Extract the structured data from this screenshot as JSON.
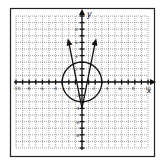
{
  "graph": {
    "axes": {
      "x_label": "x",
      "y_label": "y",
      "x_range": [
        -10,
        10
      ],
      "y_range": [
        -10,
        10
      ]
    },
    "x_ticks": [
      "-10",
      "-8",
      "-6",
      "-4",
      "-2",
      "2",
      "4",
      "6",
      "8",
      "10"
    ],
    "y_ticks": [
      "8",
      "6",
      "4",
      "2",
      "-2",
      "-4",
      "-6",
      "-8"
    ],
    "circle": {
      "cx": 0,
      "cy": 0,
      "r": 3
    },
    "v_curve": {
      "vertex": [
        0,
        -4
      ],
      "left_end": [
        -2,
        6
      ],
      "right_end": [
        2,
        6
      ]
    },
    "colors": {
      "line": "#1a1a1a",
      "grid": "#555555",
      "frame": "#222222"
    }
  }
}
